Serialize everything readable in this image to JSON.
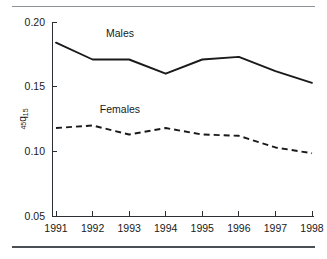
{
  "figure": {
    "has_top_rule": true,
    "has_bottom_rule": true,
    "background_color": "#ffffff",
    "ink_color": "#1a1a1a"
  },
  "chart_data": {
    "type": "line",
    "title": "",
    "xlabel": "",
    "ylabel": "45q15",
    "ylabel_parts": {
      "pre_sub": "45",
      "main": "q",
      "post_sub": "15"
    },
    "categories": [
      "1991",
      "1992",
      "1993",
      "1994",
      "1995",
      "1996",
      "1997",
      "1998"
    ],
    "x": [
      1991,
      1992,
      1993,
      1994,
      1995,
      1996,
      1997,
      1998
    ],
    "series": [
      {
        "name": "Males",
        "style": "solid",
        "color": "#1a1a1a",
        "values": [
          0.184,
          0.171,
          0.171,
          0.16,
          0.171,
          0.173,
          0.162,
          0.153
        ],
        "label_x": 1992.75,
        "label_y": 0.1885
      },
      {
        "name": "Females",
        "style": "dashed",
        "color": "#1a1a1a",
        "values": [
          0.118,
          0.12,
          0.113,
          0.118,
          0.113,
          0.112,
          0.103,
          0.0985
        ],
        "label_x": 1992.75,
        "label_y": 0.1295
      }
    ],
    "ylim": [
      0.05,
      0.2
    ],
    "yticks": [
      0.05,
      0.1,
      0.15,
      0.2
    ],
    "ytick_labels": [
      "0.05",
      "0.10",
      "0.15",
      "0.20"
    ],
    "xlim": [
      1991,
      1998
    ],
    "xticks": [
      1991,
      1992,
      1993,
      1994,
      1995,
      1996,
      1997,
      1998
    ],
    "xtick_labels": [
      "1991",
      "1992",
      "1993",
      "1994",
      "1995",
      "1996",
      "1997",
      "1998"
    ],
    "grid": false,
    "legend": "inline-labels",
    "legend_position": "on-plot"
  }
}
